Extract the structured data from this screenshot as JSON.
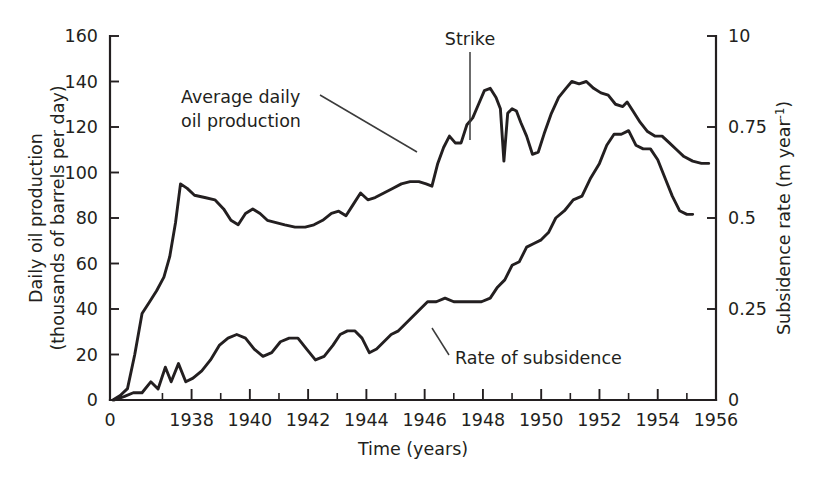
{
  "chart_data": {
    "type": "line",
    "title": "",
    "xlabel": "Time (years)",
    "ylabel": "Daily oil production (thousands of barrels per day)",
    "y2label": "Subsidence rate (m year⁻¹)",
    "xlim": [
      1935.2,
      1956.0
    ],
    "ylim": [
      0,
      160
    ],
    "y2lim": [
      0,
      1.0
    ],
    "grid": false,
    "legend_position": "inline-annotations",
    "x_ticks_major": [
      "0",
      "1938",
      "1940",
      "1942",
      "1944",
      "1946",
      "1948",
      "1950",
      "1952",
      "1954",
      "1956"
    ],
    "x_tick_major_values": [
      1935.2,
      1938,
      1940,
      1942,
      1944,
      1946,
      1948,
      1950,
      1952,
      1954,
      1956
    ],
    "x_ticks_minor_values": [
      1937,
      1939,
      1941,
      1943,
      1945,
      1947,
      1949,
      1951,
      1953,
      1955
    ],
    "y_ticks_left": [
      "0",
      "20",
      "40",
      "60",
      "80",
      "100",
      "120",
      "140",
      "160"
    ],
    "y_tick_left_values": [
      0,
      20,
      40,
      60,
      80,
      100,
      120,
      140,
      160
    ],
    "y_ticks_right": [
      "0",
      "0.25",
      "0.5",
      "0.75",
      "10"
    ],
    "y_tick_right_values": [
      0,
      0.25,
      0.5,
      0.75,
      1.0
    ],
    "annotations": [
      {
        "name": "oil-production-label",
        "text": "Average daily oil production",
        "line1": "Average daily",
        "line2": "oil production",
        "x": 1937.9,
        "y": 133
      },
      {
        "name": "strike-label",
        "text": "Strike",
        "x": 1947.9,
        "y": 157
      },
      {
        "name": "subsidence-label",
        "text": "Rate of subsidence",
        "x": 1947.6,
        "y": 24
      }
    ],
    "series": [
      {
        "name": "Average daily oil production",
        "axis": "left",
        "units": "thousands of barrels per day",
        "points": [
          [
            1935.3,
            0
          ],
          [
            1935.55,
            2
          ],
          [
            1935.8,
            5
          ],
          [
            1936.05,
            20
          ],
          [
            1936.3,
            38
          ],
          [
            1936.55,
            43
          ],
          [
            1936.8,
            48
          ],
          [
            1937.05,
            54
          ],
          [
            1937.25,
            63
          ],
          [
            1937.45,
            78
          ],
          [
            1937.62,
            95
          ],
          [
            1937.85,
            93
          ],
          [
            1938.1,
            90
          ],
          [
            1938.45,
            89
          ],
          [
            1938.8,
            88
          ],
          [
            1939.1,
            84
          ],
          [
            1939.35,
            79
          ],
          [
            1939.6,
            77
          ],
          [
            1939.85,
            82
          ],
          [
            1940.1,
            84
          ],
          [
            1940.35,
            82
          ],
          [
            1940.6,
            79
          ],
          [
            1940.9,
            78
          ],
          [
            1941.2,
            77
          ],
          [
            1941.55,
            76
          ],
          [
            1941.9,
            76
          ],
          [
            1942.2,
            77
          ],
          [
            1942.5,
            79
          ],
          [
            1942.8,
            82
          ],
          [
            1943.05,
            83
          ],
          [
            1943.3,
            81
          ],
          [
            1943.55,
            86
          ],
          [
            1943.8,
            91
          ],
          [
            1944.05,
            88
          ],
          [
            1944.3,
            89
          ],
          [
            1944.6,
            91
          ],
          [
            1944.9,
            93
          ],
          [
            1945.2,
            95
          ],
          [
            1945.5,
            96
          ],
          [
            1945.8,
            96
          ],
          [
            1946.05,
            95
          ],
          [
            1946.25,
            94
          ],
          [
            1946.45,
            104
          ],
          [
            1946.65,
            111
          ],
          [
            1946.85,
            116
          ],
          [
            1947.05,
            113
          ],
          [
            1947.25,
            113
          ],
          [
            1947.45,
            121
          ],
          [
            1947.65,
            124
          ],
          [
            1947.85,
            130
          ],
          [
            1948.05,
            136
          ],
          [
            1948.25,
            137
          ],
          [
            1948.45,
            133
          ],
          [
            1948.6,
            128
          ],
          [
            1948.72,
            105
          ],
          [
            1948.85,
            126
          ],
          [
            1949.0,
            128
          ],
          [
            1949.15,
            127
          ],
          [
            1949.3,
            122
          ],
          [
            1949.5,
            116
          ],
          [
            1949.7,
            108
          ],
          [
            1949.9,
            109
          ],
          [
            1950.1,
            117
          ],
          [
            1950.35,
            126
          ],
          [
            1950.6,
            133
          ],
          [
            1950.85,
            137
          ],
          [
            1951.05,
            140
          ],
          [
            1951.3,
            139
          ],
          [
            1951.55,
            140
          ],
          [
            1951.8,
            137
          ],
          [
            1952.05,
            135
          ],
          [
            1952.3,
            134
          ],
          [
            1952.55,
            130
          ],
          [
            1952.8,
            129
          ],
          [
            1952.95,
            131
          ],
          [
            1953.15,
            127
          ],
          [
            1953.4,
            122
          ],
          [
            1953.65,
            118
          ],
          [
            1953.9,
            116
          ],
          [
            1954.15,
            116
          ],
          [
            1954.4,
            113
          ],
          [
            1954.65,
            110
          ],
          [
            1954.9,
            107
          ],
          [
            1955.2,
            105
          ],
          [
            1955.5,
            104
          ],
          [
            1955.75,
            104
          ]
        ]
      },
      {
        "name": "Rate of subsidence",
        "axis": "right",
        "units": "m year-1",
        "points": [
          [
            1935.35,
            0
          ],
          [
            1935.7,
            1
          ],
          [
            1936.0,
            2
          ],
          [
            1936.3,
            2
          ],
          [
            1936.6,
            5
          ],
          [
            1936.85,
            3
          ],
          [
            1937.1,
            9
          ],
          [
            1937.3,
            5
          ],
          [
            1937.55,
            10
          ],
          [
            1937.8,
            5
          ],
          [
            1938.05,
            6
          ],
          [
            1938.35,
            8
          ],
          [
            1938.65,
            11
          ],
          [
            1938.95,
            15
          ],
          [
            1939.25,
            17
          ],
          [
            1939.55,
            18
          ],
          [
            1939.85,
            17
          ],
          [
            1940.15,
            14
          ],
          [
            1940.45,
            12
          ],
          [
            1940.75,
            13
          ],
          [
            1941.05,
            16
          ],
          [
            1941.35,
            17
          ],
          [
            1941.65,
            17
          ],
          [
            1941.95,
            14
          ],
          [
            1942.25,
            11
          ],
          [
            1942.55,
            12
          ],
          [
            1942.85,
            15
          ],
          [
            1943.1,
            18
          ],
          [
            1943.35,
            19
          ],
          [
            1943.6,
            19
          ],
          [
            1943.85,
            17
          ],
          [
            1944.1,
            13
          ],
          [
            1944.35,
            14
          ],
          [
            1944.6,
            16
          ],
          [
            1944.85,
            18
          ],
          [
            1945.1,
            19
          ],
          [
            1945.35,
            21
          ],
          [
            1945.6,
            23
          ],
          [
            1945.85,
            25
          ],
          [
            1946.1,
            27
          ],
          [
            1946.4,
            27
          ],
          [
            1946.7,
            28
          ],
          [
            1947.0,
            27
          ],
          [
            1947.3,
            27
          ],
          [
            1947.6,
            27
          ],
          [
            1947.95,
            27
          ],
          [
            1948.25,
            28
          ],
          [
            1948.5,
            31
          ],
          [
            1948.75,
            33
          ],
          [
            1949.0,
            37
          ],
          [
            1949.25,
            38
          ],
          [
            1949.5,
            42
          ],
          [
            1949.75,
            43
          ],
          [
            1950.0,
            44
          ],
          [
            1950.25,
            46
          ],
          [
            1950.5,
            50
          ],
          [
            1950.8,
            52
          ],
          [
            1951.1,
            55
          ],
          [
            1951.4,
            56
          ],
          [
            1951.7,
            61
          ],
          [
            1952.0,
            65
          ],
          [
            1952.25,
            70
          ],
          [
            1952.5,
            73
          ],
          [
            1952.75,
            73
          ],
          [
            1953.0,
            74
          ],
          [
            1953.25,
            70
          ],
          [
            1953.5,
            69
          ],
          [
            1953.75,
            69
          ],
          [
            1954.0,
            66
          ],
          [
            1954.25,
            61
          ],
          [
            1954.5,
            56
          ],
          [
            1954.75,
            52
          ],
          [
            1955.0,
            51
          ],
          [
            1955.2,
            51
          ]
        ]
      }
    ]
  }
}
